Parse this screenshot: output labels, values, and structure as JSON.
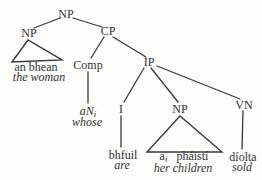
{
  "diagram": {
    "kind": "syntax-tree",
    "stroke_color": "#3a3a3a",
    "text_color": "#333231",
    "nodes": {
      "np_root": {
        "label": "NP"
      },
      "np_left": {
        "label": "NP"
      },
      "cp": {
        "label": "CP"
      },
      "comp": {
        "label": "Comp"
      },
      "ip": {
        "label": "IP"
      },
      "i": {
        "label": "I"
      },
      "np_low": {
        "label": "NP"
      },
      "vn": {
        "label": "VN"
      }
    },
    "terminals": {
      "subject": {
        "word": "an bhean",
        "gloss": "the woman"
      },
      "comp": {
        "word": "aN",
        "sub": "i",
        "gloss": "whose"
      },
      "verb": {
        "word": "bhfuil",
        "gloss": "are"
      },
      "object": {
        "word": "a",
        "sub": "i",
        "word2": "pháistí",
        "gloss": "her children"
      },
      "vn": {
        "word": "díolta",
        "gloss": "sold"
      }
    }
  }
}
